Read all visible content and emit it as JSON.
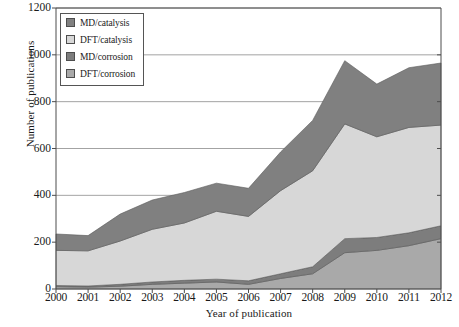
{
  "chart_data": {
    "type": "area",
    "stacked": true,
    "title": "",
    "xlabel": "Year of publication",
    "ylabel": "Number of publications",
    "categories": [
      "2000",
      "2001",
      "2002",
      "2003",
      "2004",
      "2005",
      "2006",
      "2007",
      "2008",
      "2009",
      "2010",
      "2011",
      "2012"
    ],
    "x": [
      2000,
      2001,
      2002,
      2003,
      2004,
      2005,
      2006,
      2007,
      2008,
      2009,
      2010,
      2011,
      2012
    ],
    "ylim": [
      0,
      1200
    ],
    "yticks": [
      0,
      200,
      400,
      600,
      800,
      1000,
      1200
    ],
    "xlim": [
      2000,
      2012
    ],
    "grid": "horizontal",
    "legend_position": "top-left-inside",
    "stack_order_bottom_to_top": [
      "DFT/corrosion",
      "MD/corrosion",
      "DFT/catalysis",
      "MD/catalysis"
    ],
    "series": [
      {
        "name": "MD/catalysis",
        "color": "#808080",
        "values": [
          70,
          65,
          115,
          125,
          130,
          120,
          120,
          165,
          215,
          270,
          225,
          255,
          265
        ]
      },
      {
        "name": "DFT/catalysis",
        "color": "#d7d7d7",
        "values": [
          150,
          150,
          185,
          225,
          245,
          290,
          275,
          355,
          410,
          490,
          430,
          450,
          430
        ]
      },
      {
        "name": "MD/corrosion",
        "color": "#7d7d7d",
        "values": [
          5,
          5,
          8,
          10,
          12,
          12,
          15,
          20,
          30,
          60,
          55,
          55,
          55
        ]
      },
      {
        "name": "DFT/corrosion",
        "color": "#a9a9a9",
        "values": [
          10,
          8,
          12,
          20,
          25,
          30,
          20,
          45,
          65,
          155,
          165,
          185,
          215
        ]
      }
    ],
    "totals": [
      235,
      228,
      320,
      380,
      412,
      452,
      430,
      585,
      720,
      975,
      875,
      945,
      965
    ]
  },
  "legend": {
    "items": [
      {
        "label": "MD/catalysis",
        "color": "#808080"
      },
      {
        "label": "DFT/catalysis",
        "color": "#d7d7d7"
      },
      {
        "label": "MD/corrosion",
        "color": "#7d7d7d"
      },
      {
        "label": "DFT/corrosion",
        "color": "#a9a9a9"
      }
    ]
  },
  "axes": {
    "y_label": "Number of publications",
    "x_label": "Year of publication",
    "y_ticks": [
      "0",
      "200",
      "400",
      "600",
      "800",
      "1000",
      "1200"
    ],
    "x_ticks": [
      "2000",
      "2001",
      "2002",
      "2003",
      "2004",
      "2005",
      "2006",
      "2007",
      "2008",
      "2009",
      "2010",
      "2011",
      "2012"
    ]
  },
  "colors": {
    "axis": "#4d4d4d",
    "grid": "#8c8c8c",
    "background": "#ffffff"
  }
}
